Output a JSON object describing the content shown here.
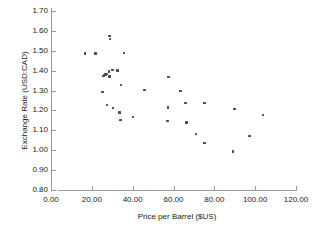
{
  "chart_data": {
    "type": "scatter",
    "title": "",
    "xlabel": "Price per Barrel ($US)",
    "ylabel": "Exchange Rate (USD:CAD)",
    "xlim": [
      0.0,
      120.0
    ],
    "ylim": [
      0.8,
      1.7
    ],
    "xticks": [
      "0.00",
      "20.00",
      "40.00",
      "60.00",
      "80.00",
      "100.00",
      "120.00"
    ],
    "xtick_values": [
      0,
      20,
      40,
      60,
      80,
      100,
      120
    ],
    "yticks": [
      "1.70",
      "1.60",
      "1.50",
      "1.40",
      "1.30",
      "1.20",
      "1.10",
      "1.00",
      "0.90",
      "0.80"
    ],
    "ytick_values": [
      1.7,
      1.6,
      1.5,
      1.4,
      1.3,
      1.2,
      1.1,
      1.0,
      0.9,
      0.8
    ],
    "grid": false,
    "legend": false,
    "marker_color": "#4d4d55",
    "axis_color": "#9a9a9a",
    "series": [
      {
        "name": "Exchange Rate vs Oil Price",
        "points": [
          [
            16.5,
            1.487
          ],
          [
            21.8,
            1.487
          ],
          [
            28.6,
            1.575
          ],
          [
            28.9,
            1.558
          ],
          [
            35.8,
            1.488
          ],
          [
            25.6,
            1.372
          ],
          [
            26.1,
            1.376
          ],
          [
            26.6,
            1.38
          ],
          [
            27.1,
            1.384
          ],
          [
            28.3,
            1.396
          ],
          [
            28.6,
            1.371
          ],
          [
            30.2,
            1.404
          ],
          [
            32.6,
            1.401
          ],
          [
            34.4,
            1.329
          ],
          [
            25.3,
            1.292
          ],
          [
            45.8,
            1.303
          ],
          [
            57.6,
            1.369
          ],
          [
            63.4,
            1.299
          ],
          [
            27.4,
            1.228
          ],
          [
            30.5,
            1.213
          ],
          [
            33.6,
            1.189
          ],
          [
            34.0,
            1.151
          ],
          [
            40.2,
            1.168
          ],
          [
            57.2,
            1.214
          ],
          [
            57.0,
            1.147
          ],
          [
            65.8,
            1.237
          ],
          [
            66.3,
            1.14
          ],
          [
            75.1,
            1.237
          ],
          [
            71.0,
            1.081
          ],
          [
            75.2,
            1.036
          ],
          [
            89.2,
            0.994
          ],
          [
            89.9,
            1.206
          ],
          [
            97.2,
            1.071
          ],
          [
            103.8,
            1.176
          ]
        ]
      }
    ]
  }
}
